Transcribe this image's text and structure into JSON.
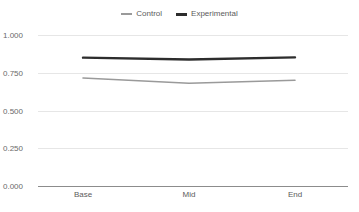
{
  "chart_data": {
    "type": "line",
    "title": "",
    "subtitle": "",
    "xlabel": "",
    "ylabel": "",
    "categories": [
      "Base",
      "Mid",
      "End"
    ],
    "ylim": [
      0.0,
      1.0
    ],
    "yticks": [
      "0.000",
      "0.250",
      "0.500",
      "0.750",
      "1.000"
    ],
    "ytick_values": [
      0.0,
      0.25,
      0.5,
      0.75,
      1.0
    ],
    "grid": "horizontal",
    "legend_position": "top-center",
    "series": [
      {
        "name": "Control",
        "color": "#9a9a9a",
        "values": [
          0.715,
          0.68,
          0.7
        ]
      },
      {
        "name": "Experimental",
        "color": "#2d2d2d",
        "values": [
          0.85,
          0.838,
          0.852
        ]
      }
    ]
  },
  "legend": {
    "items": [
      {
        "label": "Control",
        "swatch": "line-dash-gray"
      },
      {
        "label": "Experimental",
        "swatch": "line-dash-dark"
      }
    ]
  },
  "axes": {
    "y": {
      "ticks": [
        {
          "label": "1.000",
          "value": 1.0
        },
        {
          "label": "0.750",
          "value": 0.75
        },
        {
          "label": "0.500",
          "value": 0.5
        },
        {
          "label": "0.250",
          "value": 0.25
        },
        {
          "label": "0.000",
          "value": 0.0
        }
      ]
    },
    "x": {
      "ticks": [
        {
          "label": "Base"
        },
        {
          "label": "Mid"
        },
        {
          "label": "End"
        }
      ]
    }
  },
  "colors": {
    "background": "#ffffff",
    "gridline": "#e6e6e6",
    "axis": "#8c8c8c",
    "control": "#9a9a9a",
    "experimental": "#2d2d2d",
    "tick_text": "#6a6a6a",
    "legend_text": "#5b5b5b"
  }
}
